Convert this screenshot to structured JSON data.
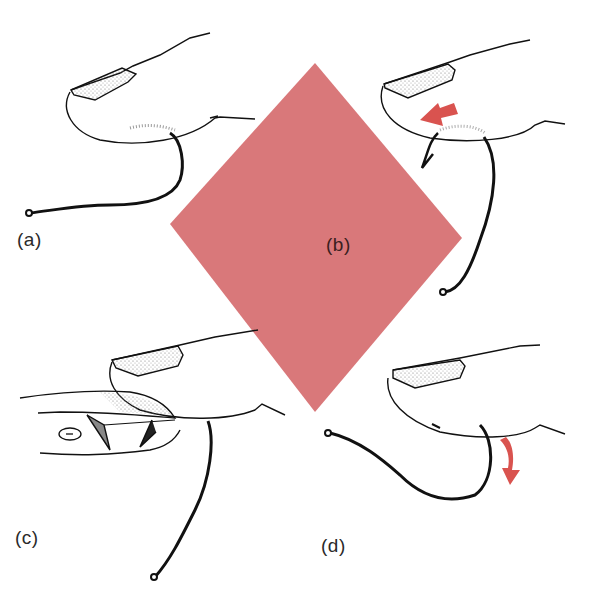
{
  "figure": {
    "colors": {
      "diamond": "#d9787a",
      "arrow": "#d9534f",
      "ink": "#111111",
      "shading": "#999999",
      "background": "#ffffff"
    },
    "panels": [
      {
        "id": "a",
        "label": "(a)",
        "content": "Fingertip with hook embedded under skin, hook eye at left"
      },
      {
        "id": "b",
        "label": "(b)",
        "content": "Hook pushed through, barb emerging; red arrow pointing down-left"
      },
      {
        "id": "c",
        "label": "(c)",
        "content": "Second finger holding cutter; barb being cut off"
      },
      {
        "id": "d",
        "label": "(d)",
        "content": "Hook backed out; red arrow pointing downward"
      }
    ]
  }
}
